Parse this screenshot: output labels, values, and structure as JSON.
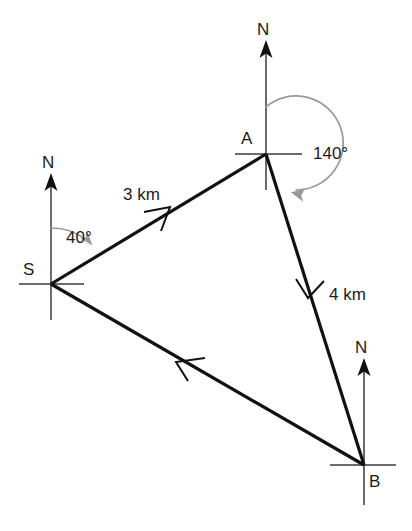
{
  "diagram": {
    "points": [
      {
        "id": "S",
        "label": "S",
        "x": 51,
        "y": 284
      },
      {
        "id": "A",
        "label": "A",
        "x": 266,
        "y": 154
      },
      {
        "id": "B",
        "label": "B",
        "x": 364,
        "y": 465
      }
    ],
    "north_labels": [
      {
        "at": "A",
        "label": "N"
      },
      {
        "at": "S",
        "label": "N"
      },
      {
        "at": "B",
        "label": "N"
      }
    ],
    "angles": [
      {
        "at": "S",
        "label": "40°",
        "value": 40,
        "from": "north",
        "direction": "clockwise"
      },
      {
        "at": "A",
        "label": "140°",
        "value": 140,
        "from": "north",
        "direction": "clockwise"
      }
    ],
    "distances": [
      {
        "from": "S",
        "to": "A",
        "label": "3 km",
        "value": 3,
        "unit": "km"
      },
      {
        "from": "A",
        "to": "B",
        "label": "4 km",
        "value": 4,
        "unit": "km"
      }
    ],
    "legs": [
      {
        "from": "S",
        "to": "A",
        "direction_marker": "forward"
      },
      {
        "from": "A",
        "to": "B",
        "direction_marker": "forward"
      },
      {
        "from": "B",
        "to": "S",
        "direction_marker": "forward"
      }
    ],
    "colors": {
      "route": "#111111",
      "axis": "#3a3a3a",
      "arc": "#9a9a9a",
      "text": "#1b1b1b",
      "background": "#ffffff"
    }
  }
}
